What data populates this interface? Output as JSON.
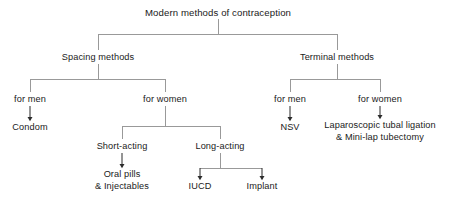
{
  "diagram": {
    "title": "Modern methods of contraception",
    "type": "tree",
    "orientation": "top-down",
    "colors": {
      "text": "#1a1a1a",
      "connector": "#999999",
      "arrow": "#2b2b2b",
      "background": "#ffffff"
    },
    "nodes": {
      "root": {
        "label": "Modern methods of contraception",
        "x": 218,
        "y": 13
      },
      "spacing_methods": {
        "label": "Spacing methods",
        "x": 98,
        "y": 58
      },
      "terminal_methods": {
        "label": "Terminal methods",
        "x": 337,
        "y": 58
      },
      "spacing_for_men": {
        "label": "for men",
        "x": 30,
        "y": 100
      },
      "spacing_for_women": {
        "label": "for women",
        "x": 165,
        "y": 100
      },
      "terminal_for_men": {
        "label": "for men",
        "x": 290,
        "y": 100
      },
      "terminal_for_women": {
        "label": "for women",
        "x": 380,
        "y": 100
      },
      "condom": {
        "label": "Condom",
        "x": 30,
        "y": 128
      },
      "nsv": {
        "label": "NSV",
        "x": 290,
        "y": 128
      },
      "female_sterilization_line1": {
        "label": "Laparoscopic tubal ligation",
        "x": 380,
        "y": 126
      },
      "female_sterilization_line2": {
        "label": "& Mini-lap tubectomy",
        "x": 380,
        "y": 137
      },
      "short_acting": {
        "label": "Short-acting",
        "x": 122,
        "y": 147
      },
      "long_acting": {
        "label": "Long-acting",
        "x": 220,
        "y": 147
      },
      "oral_pills_line1": {
        "label": "Oral pills",
        "x": 122,
        "y": 175
      },
      "oral_pills_line2": {
        "label": "& Injectables",
        "x": 122,
        "y": 187
      },
      "iucd": {
        "label": "IUCD",
        "x": 200,
        "y": 187
      },
      "implant": {
        "label": "Implant",
        "x": 262,
        "y": 187
      }
    },
    "edges": [
      {
        "from": "root",
        "to": "spacing_methods",
        "style": "elbow"
      },
      {
        "from": "root",
        "to": "terminal_methods",
        "style": "elbow"
      },
      {
        "from": "spacing_methods",
        "to": "spacing_for_men",
        "style": "elbow"
      },
      {
        "from": "spacing_methods",
        "to": "spacing_for_women",
        "style": "elbow"
      },
      {
        "from": "terminal_methods",
        "to": "terminal_for_men",
        "style": "elbow"
      },
      {
        "from": "terminal_methods",
        "to": "terminal_for_women",
        "style": "elbow"
      },
      {
        "from": "spacing_for_men",
        "to": "condom",
        "style": "arrow"
      },
      {
        "from": "terminal_for_men",
        "to": "nsv",
        "style": "arrow"
      },
      {
        "from": "terminal_for_women",
        "to": "female_sterilization_line1",
        "style": "arrow"
      },
      {
        "from": "spacing_for_women",
        "to": "short_acting",
        "style": "elbow"
      },
      {
        "from": "spacing_for_women",
        "to": "long_acting",
        "style": "elbow"
      },
      {
        "from": "short_acting",
        "to": "oral_pills_line1",
        "style": "arrow"
      },
      {
        "from": "long_acting",
        "to": "iucd",
        "style": "arrow-elbow"
      },
      {
        "from": "long_acting",
        "to": "implant",
        "style": "arrow-elbow"
      }
    ]
  }
}
